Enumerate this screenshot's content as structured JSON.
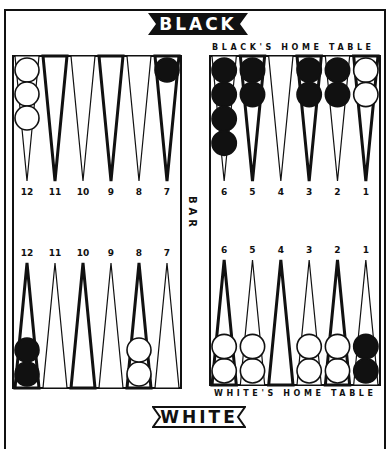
{
  "title_top": "BLACK",
  "title_bottom": "WHITE",
  "black_home_label": "BLACK'S HOME TABLE",
  "white_home_label": "WHITE'S HOME TABLE",
  "bar_label": "BAR",
  "colors": {
    "ink": "#111111",
    "paper": "#ffffff"
  },
  "boards": {
    "top_left": {
      "labels": [
        "12",
        "11",
        "10",
        "9",
        "8",
        "7"
      ],
      "checkers": [
        {
          "color": "white",
          "count": 3
        },
        {
          "color": "none",
          "count": 0
        },
        {
          "color": "none",
          "count": 0
        },
        {
          "color": "none",
          "count": 0
        },
        {
          "color": "none",
          "count": 0
        },
        {
          "color": "black",
          "count": 1
        }
      ],
      "thick": [
        false,
        true,
        false,
        true,
        false,
        true
      ]
    },
    "top_right": {
      "labels": [
        "6",
        "5",
        "4",
        "3",
        "2",
        "1"
      ],
      "checkers": [
        {
          "color": "black",
          "count": 4
        },
        {
          "color": "black",
          "count": 2
        },
        {
          "color": "none",
          "count": 0
        },
        {
          "color": "black",
          "count": 2
        },
        {
          "color": "black",
          "count": 2
        },
        {
          "color": "white",
          "count": 2
        }
      ],
      "thick": [
        false,
        true,
        false,
        true,
        false,
        true
      ]
    },
    "bottom_left": {
      "labels": [
        "12",
        "11",
        "10",
        "9",
        "8",
        "7"
      ],
      "checkers": [
        {
          "color": "black",
          "count": 2
        },
        {
          "color": "none",
          "count": 0
        },
        {
          "color": "none",
          "count": 0
        },
        {
          "color": "none",
          "count": 0
        },
        {
          "color": "white",
          "count": 2
        },
        {
          "color": "none",
          "count": 0
        }
      ],
      "thick": [
        true,
        false,
        true,
        false,
        true,
        false
      ]
    },
    "bottom_right": {
      "labels": [
        "6",
        "5",
        "4",
        "3",
        "2",
        "1"
      ],
      "checkers": [
        {
          "color": "white",
          "count": 2
        },
        {
          "color": "white",
          "count": 2
        },
        {
          "color": "none",
          "count": 0
        },
        {
          "color": "white",
          "count": 2
        },
        {
          "color": "white",
          "count": 2
        },
        {
          "color": "black",
          "count": 2
        }
      ],
      "thick": [
        true,
        false,
        true,
        false,
        true,
        false
      ]
    }
  }
}
